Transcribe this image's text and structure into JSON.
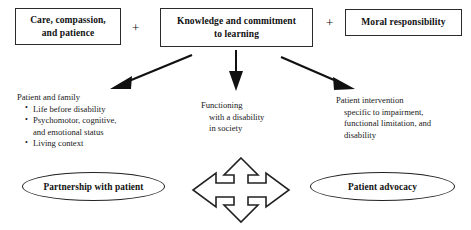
{
  "diagram": {
    "colors": {
      "background": "#ffffff",
      "stroke": "#2b2b2b",
      "text": "#111111",
      "arrow_fill": "#111111"
    },
    "top_boxes": [
      {
        "id": "care",
        "label": "Care, compassion,\nand patience",
        "line1": "Care, compassion,",
        "line2": "and patience"
      },
      {
        "id": "knowledge",
        "label": "Knowledge and commitment\nto learning",
        "line1": "Knowledge and commitment",
        "line2": "to learning"
      },
      {
        "id": "moral",
        "label": "Moral responsibility",
        "line1": "Moral responsibility",
        "line2": ""
      }
    ],
    "operators": [
      {
        "id": "plus-1",
        "symbol": "+"
      },
      {
        "id": "plus-2",
        "symbol": "+"
      }
    ],
    "arrows": [
      {
        "id": "arrow-left",
        "direction": "down-left",
        "style": "solid-filled-head"
      },
      {
        "id": "arrow-center",
        "direction": "down",
        "style": "solid-filled-head"
      },
      {
        "id": "arrow-right",
        "direction": "down-right",
        "style": "solid-filled-head"
      }
    ],
    "text_blocks": {
      "patient_family": {
        "heading": "Patient and family",
        "bullets": [
          "Life before disability",
          "Psychomotor, cognitive,",
          "Living context"
        ],
        "bullet_2_continuation": "and emotional status"
      },
      "functioning": {
        "line1": "Functioning",
        "line2": "with a disability",
        "line3": "in society"
      },
      "intervention": {
        "line1": "Patient intervention",
        "line2": "specific to impairment,",
        "line3": "functional limitation, and",
        "line4": "disability"
      }
    },
    "ellipses": [
      {
        "id": "partnership",
        "label": "Partnership with patient"
      },
      {
        "id": "advocacy",
        "label": "Patient advocacy"
      }
    ],
    "four_way_arrow": {
      "id": "four-way-arrow",
      "description": "four-directional arrow",
      "directions": [
        "up",
        "right",
        "down",
        "left"
      ]
    }
  }
}
